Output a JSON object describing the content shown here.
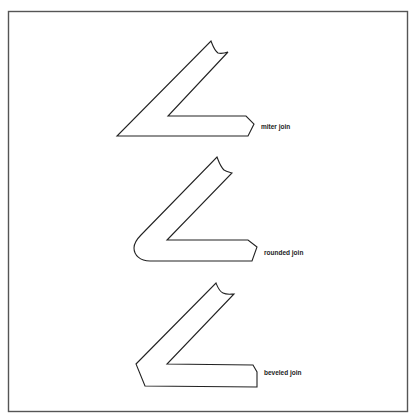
{
  "figure": {
    "type": "line-join illustration",
    "examples": [
      {
        "id": "miter",
        "label": "miter join"
      },
      {
        "id": "rounded",
        "label": "rounded join"
      },
      {
        "id": "beveled",
        "label": "beveled join"
      }
    ]
  },
  "colors": {
    "background": "#ffffff",
    "frame": "#555555",
    "stroke": "#222222",
    "text": "#222222"
  }
}
